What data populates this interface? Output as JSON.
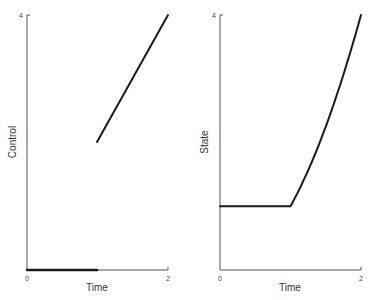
{
  "chart_data": [
    {
      "type": "line",
      "title": "",
      "xlabel": "Time",
      "ylabel": "Control",
      "xlim": [
        0,
        2
      ],
      "ylim": [
        0,
        4
      ],
      "xticks": [
        "0",
        "2"
      ],
      "yticks": [
        "4"
      ],
      "grid": false,
      "legend": null,
      "series": [
        {
          "name": "Control",
          "segments": [
            {
              "x": [
                0,
                1
              ],
              "y": [
                0,
                0
              ]
            },
            {
              "x": [
                1,
                2
              ],
              "y": [
                2,
                4
              ]
            }
          ]
        }
      ]
    },
    {
      "type": "line",
      "title": "",
      "xlabel": "Time",
      "ylabel": "State",
      "xlim": [
        0,
        2
      ],
      "ylim": [
        0,
        4
      ],
      "xticks": [
        "0",
        "2"
      ],
      "yticks": [
        "4"
      ],
      "grid": false,
      "legend": null,
      "series": [
        {
          "name": "State",
          "x": [
            0,
            1,
            1.25,
            1.5,
            1.75,
            2
          ],
          "y": [
            1,
            1,
            1.5625,
            2.25,
            3.0625,
            4
          ]
        }
      ]
    }
  ],
  "left_panel": {
    "ylabel": "Control",
    "xlabel": "Time",
    "x_tick_min": "0",
    "x_tick_max": "2",
    "y_tick_max": "4"
  },
  "right_panel": {
    "ylabel": "State",
    "xlabel": "Time",
    "x_tick_min": "0",
    "x_tick_max": "2",
    "y_tick_max": "4"
  }
}
